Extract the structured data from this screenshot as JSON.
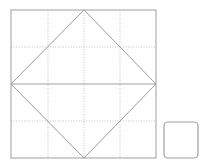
{
  "canvas": {
    "width": 208,
    "height": 164,
    "background_color": "#ffffff",
    "title": "Inscribed diamond in square with quarter grid and detached rounded square"
  },
  "colors": {
    "outer_square_stroke": "#a8a8a8",
    "diamond_stroke": "#9a9a9a",
    "grid_stroke": "#b9b9b9",
    "center_line_stroke": "#a0a0a0",
    "small_square_stroke": "#a0a0a0",
    "fill": "none"
  },
  "shapes": {
    "outer_square": {
      "name": "outer-square",
      "x": 11,
      "y": 10,
      "width": 145,
      "height": 148,
      "stroke_width": 1.1,
      "fill": "none"
    },
    "diamond": {
      "name": "inscribed-diamond",
      "points": "84,10 156,84 84,158 11,84",
      "vertices": [
        {
          "label": "top",
          "x": 84,
          "y": 10
        },
        {
          "label": "right",
          "x": 156,
          "y": 84
        },
        {
          "label": "bottom",
          "x": 84,
          "y": 158
        },
        {
          "label": "left",
          "x": 11,
          "y": 84
        }
      ],
      "stroke_width": 1.0,
      "fill": "none"
    },
    "horizontal_diameter": {
      "name": "horizontal-diameter-line",
      "x1": 11,
      "y1": 84,
      "x2": 156,
      "y2": 84,
      "stroke_width": 1.0
    },
    "grid_lines": [
      {
        "name": "grid-vertical-quarter-left",
        "orientation": "vertical",
        "x1": 48,
        "y1": 10,
        "x2": 48,
        "y2": 158
      },
      {
        "name": "grid-vertical-center",
        "orientation": "vertical",
        "x1": 84,
        "y1": 10,
        "x2": 84,
        "y2": 158
      },
      {
        "name": "grid-vertical-quarter-right",
        "orientation": "vertical",
        "x1": 120,
        "y1": 10,
        "x2": 120,
        "y2": 158
      },
      {
        "name": "grid-horizontal-quarter-top",
        "orientation": "horizontal",
        "x1": 11,
        "y1": 47,
        "x2": 156,
        "y2": 47
      },
      {
        "name": "grid-horizontal-quarter-bottom",
        "orientation": "horizontal",
        "x1": 11,
        "y1": 121,
        "x2": 156,
        "y2": 121
      }
    ],
    "small_square": {
      "name": "detached-rounded-square",
      "x": 164,
      "y": 122,
      "width": 34,
      "height": 36,
      "corner_radius": 4,
      "stroke_width": 1.2,
      "fill": "none"
    }
  }
}
